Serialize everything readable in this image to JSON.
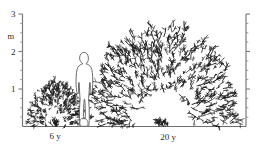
{
  "figure": {
    "kind": "scientific-illustration",
    "background_color": "#ffffff",
    "ink_color": "#1a1a1a"
  },
  "y_axis_left": {
    "name": "left-vertical-scale",
    "unit_label": "m",
    "labeled_ticks": [
      {
        "value": 1,
        "label": "1"
      },
      {
        "value": 2,
        "label": "2"
      },
      {
        "value": 3,
        "label": "3"
      }
    ],
    "minor_tick_step": 0.25,
    "range": [
      0,
      3
    ],
    "axis_color": "#7a7a7a"
  },
  "y_axis_right": {
    "name": "right-vertical-scale",
    "labels_shown": false,
    "range": [
      0,
      3
    ],
    "minor_tick_step": 0.25,
    "axis_color": "#7a7a7a"
  },
  "baseline": {
    "name": "ground-line",
    "color": "#6e6e6e"
  },
  "plants": [
    {
      "id": "small-shrub",
      "age_label": "6 y",
      "height_m": 1.2,
      "width_m": 1.3,
      "stroke_count": 240
    },
    {
      "id": "large-shrub",
      "age_label": "20 y",
      "height_m": 2.7,
      "width_m": 5.4,
      "stroke_count": 520
    }
  ],
  "human_figure": {
    "name": "human-scale-silhouette",
    "height_m": 1.78,
    "filled": false
  },
  "chart_data": {
    "type": "bar",
    "title": "",
    "xlabel": "",
    "ylabel": "m",
    "categories": [
      "6 y",
      "20 y"
    ],
    "values": [
      1.2,
      2.7
    ],
    "series": [
      {
        "name": "shrub height (m)",
        "values": [
          1.2,
          2.7
        ]
      },
      {
        "name": "shrub crown width (m)",
        "values": [
          1.3,
          5.4
        ]
      }
    ],
    "reference_items": [
      {
        "name": "human",
        "height_m": 1.78
      }
    ],
    "ylim": [
      0,
      3
    ],
    "yticks": [
      1,
      2,
      3
    ],
    "grid": false,
    "legend": "none"
  }
}
